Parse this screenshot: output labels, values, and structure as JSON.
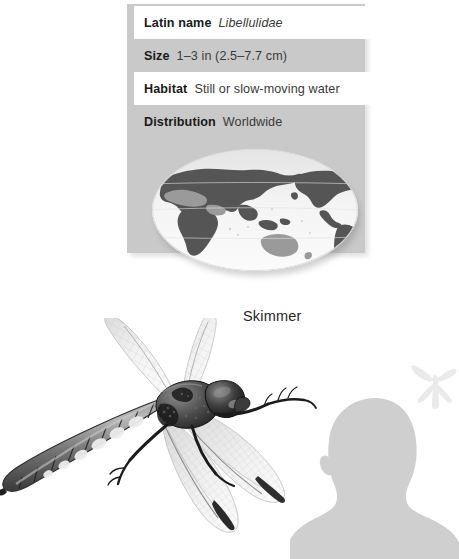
{
  "page": {
    "background_color": "#ffffff",
    "card_color": "#c9c9c9",
    "row_white_color": "#ffffff",
    "text_color": "#2b2b2b"
  },
  "fact_card": {
    "rows": [
      {
        "label": "Latin name",
        "value": "Libellulidae",
        "italic": true,
        "band": "white"
      },
      {
        "label": "Size",
        "value": "1–3 in (2.5–7.7 cm)",
        "italic": false,
        "band": "shaded"
      },
      {
        "label": "Habitat",
        "value": "Still or slow-moving water",
        "italic": false,
        "band": "white"
      },
      {
        "label": "Distribution",
        "value": "Worldwide",
        "italic": false,
        "band": "shaded"
      }
    ]
  },
  "globe": {
    "icon": "world-map-oval-icon",
    "ocean_color": "#f2f2f2",
    "land_color": "#555555",
    "land_highlight_color": "#9a9a9a"
  },
  "caption": {
    "species_name": "Skimmer"
  },
  "illustration": {
    "icon": "dragonfly-illustration-icon",
    "subject": "Skimmer dragonfly"
  },
  "scale_reference": {
    "human_icon": "human-head-shoulders-silhouette-icon",
    "human_color": "#cfcfcf",
    "dragonfly_icon": "dragonfly-scale-silhouette-icon",
    "dragonfly_color": "#ececec"
  }
}
